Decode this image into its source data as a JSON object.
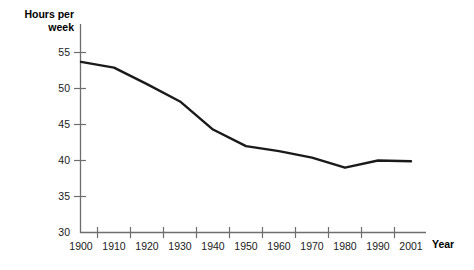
{
  "chart_data": {
    "type": "line",
    "title": "",
    "ylabel": "Hours per\nweek",
    "xlabel": "Year",
    "x": [
      1900,
      1910,
      1920,
      1930,
      1940,
      1950,
      1960,
      1970,
      1980,
      1990,
      2001
    ],
    "values": [
      53.7,
      52.9,
      50.6,
      48.2,
      44.3,
      42.0,
      41.3,
      40.4,
      39.0,
      40.0,
      39.9
    ],
    "series": [
      {
        "name": "Hours per week",
        "values": [
          53.7,
          52.9,
          50.6,
          48.2,
          44.3,
          42.0,
          41.3,
          40.4,
          39.0,
          40.0,
          39.9
        ]
      }
    ],
    "xtick_labels": [
      "1900",
      "1910",
      "1920",
      "1930",
      "1940",
      "1950",
      "1960",
      "1970",
      "1980",
      "1990",
      "2001"
    ],
    "ytick_labels": [
      "30",
      "35",
      "40",
      "45",
      "50",
      "55"
    ],
    "ytick_values": [
      30,
      35,
      40,
      45,
      50,
      55
    ],
    "ylim": [
      30,
      56
    ],
    "xlim": [
      1900,
      2005
    ],
    "grid": false,
    "legend": "none",
    "line_color": "#1a1a1a",
    "axis_color": "#808080"
  },
  "axes": {
    "y_title": "Hours per\nweek",
    "x_title": "Year"
  }
}
